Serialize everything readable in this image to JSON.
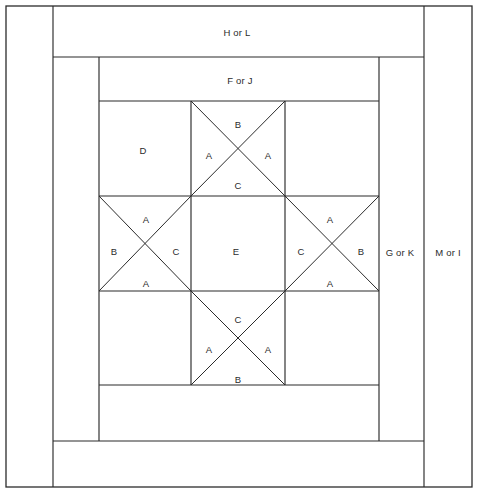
{
  "diagram": {
    "type": "quilt-block-piecing-diagram",
    "line_color": "#2b2b2b",
    "background_color": "#ffffff",
    "width": 481,
    "height": 498
  },
  "borders": {
    "top_band_label": "H or L",
    "inner_top_band_label": "F or J",
    "right_inner_band_label": "G or K",
    "right_outer_band_label": "M or I"
  },
  "star_block": {
    "center_label": "E",
    "corner_square_label": "D",
    "quarter_square_units": [
      {
        "name": "top-center",
        "top": "B",
        "left": "A",
        "right": "A",
        "bottom": "C"
      },
      {
        "name": "middle-left",
        "top": "A",
        "left": "B",
        "right": "C",
        "bottom": "A"
      },
      {
        "name": "middle-right",
        "top": "A",
        "left": "C",
        "right": "B",
        "bottom": "A"
      },
      {
        "name": "bottom-center",
        "top": "C",
        "left": "A",
        "right": "A",
        "bottom": "B"
      }
    ]
  },
  "labels": [
    {
      "id": "h-or-l",
      "text": "H or L",
      "x": 237,
      "y": 32
    },
    {
      "id": "f-or-j",
      "text": "F or J",
      "x": 240,
      "y": 80
    },
    {
      "id": "g-or-k",
      "text": "G or K",
      "x": 400,
      "y": 252
    },
    {
      "id": "m-or-i",
      "text": "M or I",
      "x": 448,
      "y": 252
    },
    {
      "id": "d",
      "text": "D",
      "x": 143,
      "y": 150
    },
    {
      "id": "tc-b",
      "text": "B",
      "x": 238,
      "y": 124
    },
    {
      "id": "tc-a-l",
      "text": "A",
      "x": 209,
      "y": 155
    },
    {
      "id": "tc-a-r",
      "text": "A",
      "x": 268,
      "y": 155
    },
    {
      "id": "tc-c",
      "text": "C",
      "x": 238,
      "y": 185
    },
    {
      "id": "ml-a-t",
      "text": "A",
      "x": 146,
      "y": 219
    },
    {
      "id": "ml-b",
      "text": "B",
      "x": 114,
      "y": 251
    },
    {
      "id": "ml-c",
      "text": "C",
      "x": 176,
      "y": 251
    },
    {
      "id": "ml-a-b",
      "text": "A",
      "x": 146,
      "y": 283
    },
    {
      "id": "e",
      "text": "E",
      "x": 236,
      "y": 251
    },
    {
      "id": "mr-a-t",
      "text": "A",
      "x": 330,
      "y": 219
    },
    {
      "id": "mr-c",
      "text": "C",
      "x": 301,
      "y": 251
    },
    {
      "id": "mr-b",
      "text": "B",
      "x": 361,
      "y": 251
    },
    {
      "id": "mr-a-b",
      "text": "A",
      "x": 330,
      "y": 283
    },
    {
      "id": "bc-c",
      "text": "C",
      "x": 238,
      "y": 319
    },
    {
      "id": "bc-a-l",
      "text": "A",
      "x": 209,
      "y": 349
    },
    {
      "id": "bc-a-r",
      "text": "A",
      "x": 268,
      "y": 349
    },
    {
      "id": "bc-b",
      "text": "B",
      "x": 238,
      "y": 379
    }
  ],
  "geometry": {
    "outer_frame": {
      "x": 6,
      "y": 6,
      "w": 466,
      "h": 481
    },
    "left_border_x": 53,
    "star_left_x": 99,
    "star_right_x": 379,
    "star_top_y": 101,
    "star_bottom_y": 385,
    "inner_band_right_x": 424,
    "top_band_bottom_y": 57,
    "inner_band_bottom_y": 441,
    "cell_size": 94
  }
}
